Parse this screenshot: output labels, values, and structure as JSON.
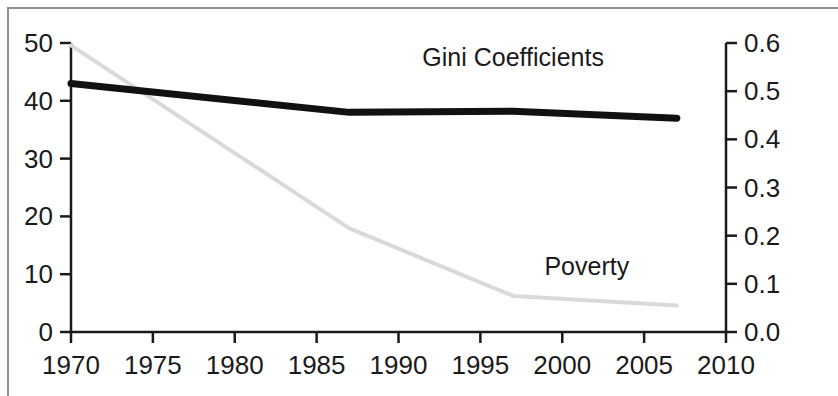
{
  "chart_data": {
    "type": "line",
    "title": "",
    "subtitle": "",
    "xlabel": "",
    "ylabel": "",
    "y2label": "",
    "xlim": [
      1970,
      2010
    ],
    "ylim": [
      0,
      50
    ],
    "y2lim": [
      0.0,
      0.6
    ],
    "grid": false,
    "legend_position": "inline-annotation",
    "x_ticks": [
      1970,
      1975,
      1980,
      1985,
      1990,
      1995,
      2000,
      2005,
      2010
    ],
    "x_tick_labels": [
      "1970",
      "1975",
      "1980",
      "1985",
      "1990",
      "1995",
      "2000",
      "2005",
      "2010"
    ],
    "y_ticks": [
      0,
      10,
      20,
      30,
      40,
      50
    ],
    "y_tick_labels": [
      "0",
      "10",
      "20",
      "30",
      "40",
      "50"
    ],
    "y2_ticks": [
      0.0,
      0.1,
      0.2,
      0.3,
      0.4,
      0.5,
      0.6
    ],
    "y2_tick_labels": [
      "0.0",
      "0.1",
      "0.2",
      "0.3",
      "0.4",
      "0.5",
      "0.6"
    ],
    "series": [
      {
        "name": "Poverty",
        "label": "Poverty",
        "axis": "right",
        "color": "#d9d9d9",
        "line_width": 4,
        "x": [
          1970,
          1987,
          1997,
          2007
        ],
        "values": [
          0.595,
          0.215,
          0.075,
          0.055
        ]
      },
      {
        "name": "Gini Coefficients",
        "label": "Gini Coefficients",
        "axis": "left",
        "color": "#111111",
        "line_width": 7,
        "x": [
          1970,
          1987,
          1997,
          2007
        ],
        "values": [
          43.0,
          38.0,
          38.2,
          37.0
        ]
      }
    ],
    "annotations": [
      {
        "text": "Gini Coefficients",
        "x": 1997,
        "y": 46.0,
        "axis": "left"
      },
      {
        "text": "Poverty",
        "x": 2001.5,
        "y": 9.8,
        "axis": "left"
      }
    ]
  },
  "axes": {
    "left": {
      "labels": [
        "50",
        "40",
        "30",
        "20",
        "10",
        "0"
      ]
    },
    "right": {
      "labels": [
        "0.6",
        "0.5",
        "0.4",
        "0.3",
        "0.2",
        "0.1",
        "0.0"
      ]
    },
    "bottom": {
      "labels": [
        "1970",
        "1975",
        "1980",
        "1985",
        "1990",
        "1995",
        "2000",
        "2005",
        "2010"
      ]
    }
  },
  "annotations": {
    "gini": "Gini Coefficients",
    "poverty": "Poverty"
  },
  "colors": {
    "gini_line": "#111111",
    "poverty_line": "#d9d9d9",
    "axis": "#1a1a1a",
    "frame": "#8f8f8f",
    "background": "#ffffff"
  }
}
